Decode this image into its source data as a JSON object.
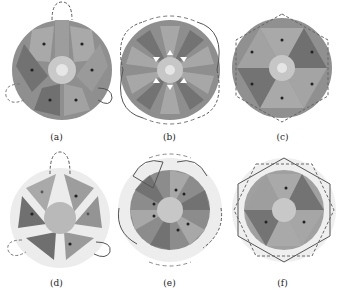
{
  "figure": {
    "panels": [
      {
        "id": "a",
        "label": "(a)",
        "description": "6-slot stator with 3 concentrated coils, tooth-wound, dashed/solid end loops"
      },
      {
        "id": "b",
        "label": "(b)",
        "description": "12-slot stator with overlapping end windings"
      },
      {
        "id": "c",
        "label": "(c)",
        "description": "6-pole rotor with hexagonal winding"
      },
      {
        "id": "d",
        "label": "(d)",
        "description": "3-slot stator with open slots"
      },
      {
        "id": "e",
        "label": "(e)",
        "description": "12-sector stator with four-lobe windings"
      },
      {
        "id": "f",
        "label": "(f)",
        "description": "6-sector stator with hexagonal overlapping windings"
      }
    ],
    "colors": {
      "dark": "#6e6e6e",
      "mid": "#8c8c8c",
      "light": "#a8a8a8",
      "outer": "#999999",
      "ring": "#dddddd",
      "hub": "#c8c8c8",
      "wire": "#555555"
    }
  }
}
